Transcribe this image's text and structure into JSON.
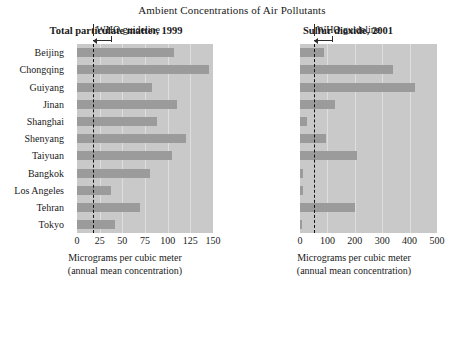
{
  "chart_data": {
    "type": "bar",
    "title": "Ambient Concentrations of Air Pollutants",
    "orientation": "horizontal",
    "grid": true,
    "legend": "none",
    "categories": [
      "Beijing",
      "Chongqing",
      "Guiyang",
      "Jinan",
      "Shanghai",
      "Shenyang",
      "Taiyuan",
      "Bangkok",
      "Los Angeles",
      "Tehran",
      "Tokyo"
    ],
    "panels": [
      {
        "title": "Total particulate matter, 1999",
        "xlabel_line1": "Micrograms per cubic meter",
        "xlabel_line2": "(annual mean concentration)",
        "xlim": [
          0,
          150
        ],
        "xticks": [
          0,
          25,
          50,
          75,
          100,
          125,
          150
        ],
        "xtick_labels": [
          "0",
          "25",
          "50",
          "75",
          "100",
          "125",
          "150"
        ],
        "guideline_label": "WHO guideline",
        "guideline_value": 18,
        "values": [
          107,
          146,
          83,
          110,
          88,
          120,
          105,
          81,
          38,
          69,
          42
        ]
      },
      {
        "title": "Sulfur dioxide, 2001",
        "xlabel_line1": "Micrograms per cubic meter",
        "xlabel_line2": "(annual mean concentration)",
        "xlim": [
          0,
          500
        ],
        "xticks": [
          0,
          100,
          200,
          300,
          400,
          500
        ],
        "xtick_labels": [
          "0",
          "100",
          "200",
          "300",
          "400",
          "500"
        ],
        "guideline_label": "WHO guideline",
        "guideline_value": 50,
        "values": [
          88,
          338,
          418,
          128,
          25,
          95,
          208,
          11,
          11,
          202,
          5
        ]
      }
    ]
  },
  "colors": {
    "bar": "#9b9b9b",
    "plot_background": "#c9c9c9",
    "gridline": "#dedede",
    "guideline": "#111111",
    "text": "#1a1a1a"
  },
  "title": "Ambient Concentrations of Air Pollutants",
  "left": {
    "title": "Total particulate matter, 1999",
    "who": "WHO guideline",
    "axis_line1": "Micrograms per cubic meter",
    "axis_line2": "(annual mean concentration)",
    "ticks": [
      "0",
      "25",
      "50",
      "75",
      "100",
      "125",
      "150"
    ],
    "cats": [
      "Beijing",
      "Chongqing",
      "Guiyang",
      "Jinan",
      "Shanghai",
      "Shenyang",
      "Taiyuan",
      "Bangkok",
      "Los Angeles",
      "Tehran",
      "Tokyo"
    ]
  },
  "right": {
    "title": "Sulfur dioxide, 2001",
    "who": "WHO guideline",
    "axis_line1": "Micrograms per cubic meter",
    "axis_line2": "(annual mean concentration)",
    "ticks": [
      "0",
      "100",
      "200",
      "300",
      "400",
      "500"
    ],
    "cats": [
      "Beijing",
      "Chongqing",
      "Guiyang",
      "Jinan",
      "Shanghai",
      "Shenyang",
      "Taiyuan",
      "Bangkok",
      "Los Angeles",
      "Tehran",
      "Tokyo"
    ]
  }
}
